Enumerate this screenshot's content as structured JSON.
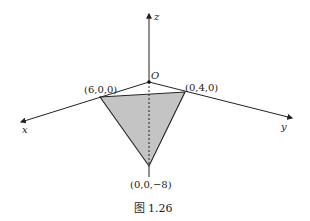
{
  "figure": {
    "caption": "图 1.26",
    "axes": {
      "x_label": "x",
      "y_label": "y",
      "z_label": "z",
      "origin_label": "O"
    },
    "points": {
      "x_intercept": "(6,0,0)",
      "y_intercept": "(0,4,0)",
      "z_intercept": "(0,0,−8)"
    },
    "colors": {
      "fill": "#c4c4c4",
      "stroke": "#222222"
    }
  }
}
